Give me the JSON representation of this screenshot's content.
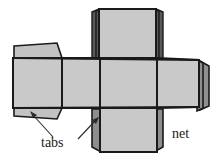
{
  "figure": {
    "name": "cube-net-with-tabs",
    "width": 218,
    "height": 162,
    "background_color": "#ffffff"
  },
  "colors": {
    "face_fill": "#c9c9c9",
    "tab_light_fill": "#c2c2c2",
    "tab_dark_fill": "#8e8e8e",
    "tab_darker_fill": "#5a5a5a",
    "outline": "#1a1a1a",
    "leader": "#2a2a2a",
    "text": "#1a1a1a"
  },
  "labels": {
    "tabs": "tabs",
    "net": "net"
  },
  "annotations": [
    {
      "id": "tabs-label",
      "text": "tabs",
      "x": 59,
      "y": 146,
      "leaders": 2,
      "targets": [
        "left-arm-lower-tab",
        "bottom-flap-left-tab"
      ]
    },
    {
      "id": "net-label",
      "text": "net",
      "x": 186,
      "y": 137,
      "leaders": 0,
      "targets": []
    }
  ],
  "net_structure": {
    "faces": [
      {
        "id": "left-arm-face",
        "name": "left-face"
      },
      {
        "id": "center-left-face",
        "name": "front-face"
      },
      {
        "id": "center-face",
        "name": "bottom-face"
      },
      {
        "id": "center-right-face",
        "name": "back-face"
      },
      {
        "id": "right-arm-face",
        "name": "right-face"
      },
      {
        "id": "top-flap-face",
        "name": "top-face"
      },
      {
        "id": "bottom-flap-face",
        "name": "under-face"
      }
    ],
    "tabs": [
      {
        "id": "left-arm-upper-tab",
        "shade": "light"
      },
      {
        "id": "left-arm-lower-tab",
        "shade": "light"
      },
      {
        "id": "top-flap-left-tab",
        "shade": "darker"
      },
      {
        "id": "top-flap-right-tab",
        "shade": "darker"
      },
      {
        "id": "bottom-flap-left-tab",
        "shade": "dark"
      },
      {
        "id": "bottom-flap-right-tab",
        "shade": "dark"
      },
      {
        "id": "right-arm-tab",
        "shade": "dark"
      }
    ]
  }
}
